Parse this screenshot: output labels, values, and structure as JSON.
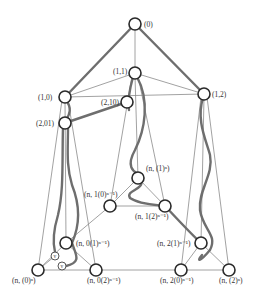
{
  "diagram": {
    "title": "",
    "nodes": [
      {
        "id": "root",
        "label": "(0)",
        "x": 135,
        "y": 24,
        "lx": 145,
        "ly": 27
      },
      {
        "id": "n11",
        "label": "(1,1)",
        "x": 135,
        "y": 73,
        "lx": 113,
        "ly": 74
      },
      {
        "id": "n10",
        "label": "(1,0)",
        "x": 65,
        "y": 97,
        "lx": 38,
        "ly": 100
      },
      {
        "id": "n12",
        "label": "(1,2)",
        "x": 204,
        "y": 94,
        "lx": 213,
        "ly": 97
      },
      {
        "id": "n210",
        "label": "(2,10)",
        "x": 127,
        "y": 102,
        "lx": 101,
        "ly": 105
      },
      {
        "id": "n201",
        "label": "(2,01)",
        "x": 65,
        "y": 123,
        "lx": 36,
        "ly": 126
      },
      {
        "id": "nn1",
        "label": "(n, (1)ⁿ)",
        "x": 138,
        "y": 178,
        "lx": 147,
        "ly": 172
      },
      {
        "id": "nn10",
        "label": "(n, 1(0)ⁿ⁻¹)",
        "x": 110,
        "y": 206,
        "lx": 86,
        "ly": 195
      },
      {
        "id": "nn12",
        "label": "(n, 1(2)ⁿ⁻¹)",
        "x": 165,
        "y": 206,
        "lx": 136,
        "ly": 219
      },
      {
        "id": "nn01",
        "label": "(n, 0(1)ⁿ⁻¹)",
        "x": 66,
        "y": 243,
        "lx": 77,
        "ly": 246
      },
      {
        "id": "nn21",
        "label": "(n, 2(1)ⁿ⁻¹)",
        "x": 201,
        "y": 243,
        "lx": 157,
        "ly": 246
      },
      {
        "id": "nn0",
        "label": "(n, (0)ⁿ)",
        "x": 38,
        "y": 270,
        "lx": 12,
        "ly": 283
      },
      {
        "id": "nn02",
        "label": "(n, 0(2)ⁿ⁻¹)",
        "x": 96,
        "y": 270,
        "lx": 87,
        "ly": 283
      },
      {
        "id": "nn20",
        "label": "(n, 2(0)ⁿ⁻¹)",
        "x": 181,
        "y": 270,
        "lx": 160,
        "ly": 283
      },
      {
        "id": "nn2",
        "label": "(n, (2)ⁿ)",
        "x": 229,
        "y": 270,
        "lx": 219,
        "ly": 283
      }
    ],
    "small_nodes": [
      {
        "id": "v1",
        "label": "v",
        "x": 55,
        "y": 256
      },
      {
        "id": "v2",
        "label": "v",
        "x": 62,
        "y": 266
      }
    ],
    "thick_edges": [
      [
        "root",
        "n10"
      ],
      [
        "root",
        "n12"
      ],
      [
        "n201",
        "n210"
      ]
    ],
    "labels_display": {
      "root": "(0)",
      "n11": "(1,1)",
      "n10": "(1,0)",
      "n12": "(1,2)",
      "n210": "(2,10)",
      "n201": "(2,01)",
      "nn1": "(n, (1)ⁿ)",
      "nn10": "(n, 1(0)ⁿ⁻¹)",
      "nn12": "(n, 1(2)ⁿ⁻¹)",
      "nn01": "(n, 0(1)ⁿ⁻¹)",
      "nn21": "(n, 2(1)ⁿ⁻¹)",
      "nn0": "(n, (0)ⁿ)",
      "nn02": "(n, 0(2)ⁿ⁻¹)",
      "nn20": "(n, 2(0)ⁿ⁻¹)",
      "nn2": "(n, (2)ⁿ)",
      "v1": "v",
      "v2": "v"
    }
  }
}
